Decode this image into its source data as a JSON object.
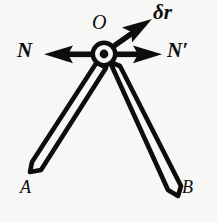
{
  "figure": {
    "background_color": "#f7f7f5",
    "ink_color": "#0d0d0d",
    "labels": {
      "pivot": "O",
      "left_force": "N",
      "right_force": "N′",
      "displacement": "δr",
      "left_rod_end": "A",
      "right_rod_end": "B"
    },
    "elements": {
      "pivot_node": "pivot-hinge",
      "left_arrow": "left-force-arrow",
      "right_arrow": "right-force-arrow",
      "displacement_arrow": "displacement-arrow",
      "left_rod": "rod-OA",
      "right_rod": "rod-OB"
    }
  }
}
